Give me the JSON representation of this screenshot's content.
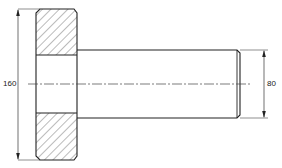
{
  "drawing": {
    "type": "technical-section-drawing",
    "subject": "flanged shaft / hub cross-section",
    "colors": {
      "line": "#222222",
      "hatch": "#555555",
      "background": "#ffffff"
    },
    "dimensions": [
      {
        "id": "flange-diameter",
        "value": "160",
        "orientation": "vertical",
        "side": "left"
      },
      {
        "id": "shaft-diameter",
        "value": "80",
        "orientation": "vertical",
        "side": "right"
      }
    ],
    "features": {
      "flange": {
        "hatched": true,
        "chamfered_corners": true
      },
      "bore": {
        "hatched": false
      },
      "shaft": {
        "chamfered_end": true
      },
      "center_line": {
        "style": "dash-dot"
      }
    }
  }
}
